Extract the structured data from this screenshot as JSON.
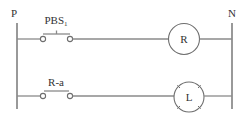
{
  "diagram": {
    "type": "ladder-logic",
    "rails": {
      "left_label": "P",
      "right_label": "N"
    },
    "rungs": [
      {
        "contact": {
          "label": "PBS",
          "label_subscript": "1",
          "kind": "pushbutton-normally-open"
        },
        "output": {
          "label": "R",
          "kind": "relay-coil"
        }
      },
      {
        "contact": {
          "label": "R-a",
          "kind": "relay-contact-normally-open"
        },
        "output": {
          "label": "L",
          "kind": "lamp"
        }
      }
    ],
    "colors": {
      "line": "#8a8a8a",
      "text": "#333333",
      "background": "#ffffff"
    }
  }
}
